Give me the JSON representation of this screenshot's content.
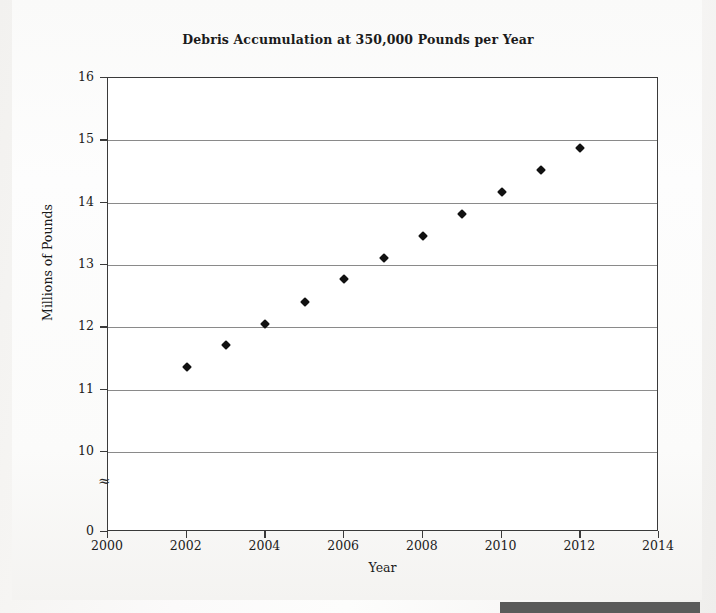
{
  "chart_data": {
    "type": "scatter",
    "title": "Debris Accumulation at 350,000 Pounds per Year",
    "xlabel": "Year",
    "ylabel": "Millions of Pounds",
    "xlim": [
      2000,
      2014
    ],
    "ylim": [
      10,
      16
    ],
    "y_axis_break": true,
    "y_axis_break_symbol": "≈",
    "y_zero_tick": "0",
    "grid": true,
    "grid_axis": "y",
    "legend": "none",
    "marker": "diamond",
    "marker_color": "#111111",
    "xticks": [
      "2000",
      "2002",
      "2004",
      "2006",
      "2008",
      "2010",
      "2012",
      "2014"
    ],
    "xtick_values": [
      2000,
      2002,
      2004,
      2006,
      2008,
      2010,
      2012,
      2014
    ],
    "yticks": [
      "16",
      "15",
      "14",
      "13",
      "12",
      "11",
      "10",
      "0"
    ],
    "ytick_values": [
      16,
      15,
      14,
      13,
      12,
      11,
      10
    ],
    "x": [
      2002,
      2003,
      2004,
      2005,
      2006,
      2007,
      2008,
      2009,
      2010,
      2011,
      2012
    ],
    "values": [
      11.36,
      11.71,
      12.06,
      12.41,
      12.77,
      13.12,
      13.47,
      13.82,
      14.17,
      14.53,
      14.88
    ],
    "series": [
      {
        "name": "Debris accumulation",
        "values": [
          11.36,
          11.71,
          12.06,
          12.41,
          12.77,
          13.12,
          13.47,
          13.82,
          14.17,
          14.53,
          14.88
        ]
      }
    ]
  },
  "colors": {
    "axis": "#3a3a3a",
    "gridline": "#8a8a8a",
    "marker": "#111111",
    "text": "#1b1b1b",
    "paper": "#faf9f8"
  }
}
